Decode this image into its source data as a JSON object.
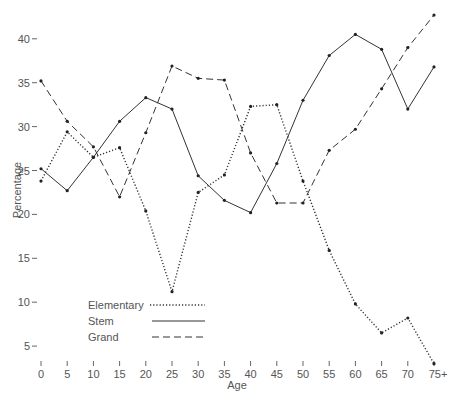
{
  "chart_data": {
    "type": "line",
    "title": "",
    "xlabel": "Age",
    "ylabel": "Percentage",
    "categories": [
      "0",
      "5",
      "10",
      "15",
      "20",
      "25",
      "30",
      "35",
      "40",
      "45",
      "50",
      "55",
      "60",
      "65",
      "70",
      "75+"
    ],
    "y_ticks": [
      "5",
      "10",
      "15",
      "20",
      "25",
      "30",
      "35",
      "40"
    ],
    "ylim": [
      0,
      43
    ],
    "grid": false,
    "legend_position": "lower-left inside",
    "series": [
      {
        "name": "Elementary",
        "style": "dotted",
        "values": [
          23.8,
          29.4,
          26.5,
          27.6,
          20.4,
          11.2,
          22.5,
          24.5,
          32.3,
          32.5,
          23.8,
          15.9,
          9.8,
          6.5,
          8.2,
          3.0
        ]
      },
      {
        "name": "Stem",
        "style": "solid",
        "values": [
          25.2,
          22.7,
          26.5,
          30.6,
          33.3,
          32.0,
          24.4,
          21.6,
          20.2,
          25.8,
          33.0,
          38.1,
          40.5,
          38.8,
          32.0,
          36.8
        ]
      },
      {
        "name": "Grand",
        "style": "dashed",
        "values": [
          35.2,
          30.6,
          27.7,
          22.0,
          29.3,
          36.9,
          35.5,
          35.3,
          27.0,
          21.3,
          21.3,
          27.3,
          29.7,
          34.3,
          39.0,
          42.7
        ]
      }
    ]
  },
  "colors": {
    "line": "#333333",
    "text": "#555555"
  }
}
